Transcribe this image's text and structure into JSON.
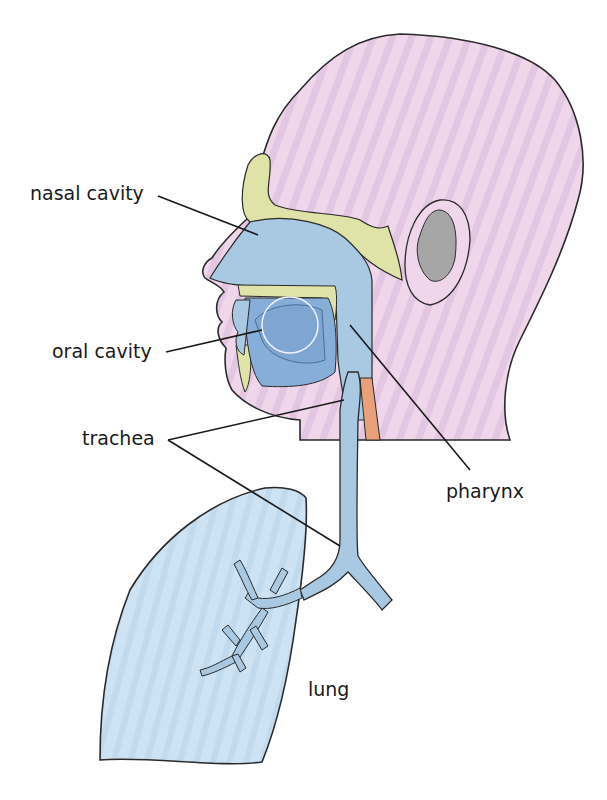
{
  "diagram": {
    "labels": {
      "nasal_cavity": "nasal cavity",
      "oral_cavity": "oral cavity",
      "trachea": "trachea",
      "pharynx": "pharynx",
      "lung": "lung"
    },
    "colors": {
      "skin": "#efd3e8",
      "skin_stripe": "#e2c3e0",
      "bone": "#dfe3a8",
      "airway": "#a9c9e3",
      "oral": "#86aed8",
      "ear_inner": "#a6a6a6",
      "esophagus": "#e9a17c",
      "lung": "#c9dff0",
      "outline": "#2a2a2a"
    }
  }
}
